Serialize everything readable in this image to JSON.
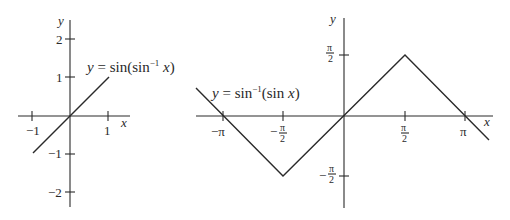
{
  "left_graph": {
    "title": "y = sin(sin⁻¹ x)",
    "equation_parts": {
      "y": "y",
      "eq": " = sin(sin",
      "sup": "−1",
      "x": " x",
      "close": ")"
    },
    "x_axis_label": "x",
    "y_axis_label": "y",
    "x_ticks": [
      "−1",
      "1"
    ],
    "y_ticks": [
      "2",
      "1",
      "−1",
      "−2"
    ],
    "domain": [
      -1,
      1
    ],
    "range": [
      -1,
      1
    ]
  },
  "right_graph": {
    "title": "y = sin⁻¹(sin x)",
    "equation_parts": {
      "y": "y",
      "eq": " = sin",
      "sup": "−1",
      "rest": "(sin ",
      "x": "x",
      "close": ")"
    },
    "x_axis_label": "x",
    "y_axis_label": "y",
    "x_ticks": {
      "neg_pi": "−π",
      "neg_half_pi_sign": "−",
      "pi": "π",
      "pi_sym": "π",
      "two": "2"
    },
    "y_ticks": {
      "pi_over_2": "π/2",
      "neg_pi_over_2": "−π/2"
    },
    "vertices": [
      {
        "x": "-π-ε",
        "y": "ε"
      },
      {
        "x": "-π/2",
        "y": "-π/2"
      },
      {
        "x": "π/2",
        "y": "π/2"
      },
      {
        "x": "π+ε",
        "y": "-ε"
      }
    ]
  }
}
